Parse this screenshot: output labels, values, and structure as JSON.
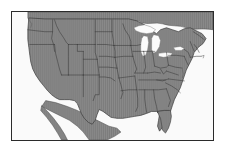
{
  "figure": {
    "kind": "map",
    "projection_hint": "equirectangular-like lon/lat plate",
    "frame": {
      "border_color": "#2b2b2b",
      "border_width_px": 1,
      "background_color": "#ffffff"
    }
  },
  "style": {
    "land_fill": "#8a8a8a",
    "land_hatch_color": "#767676",
    "land_hatch_orientation": "vertical",
    "water_fill": "#f7f7f7",
    "lake_fill": "#fbfbfb",
    "state_border_color": "#3a3a3a",
    "coastline_color": "#4a4a4a",
    "neighbor_fill": "#8a8a8a",
    "ocean_fill": "#fafafa"
  },
  "legend": {
    "present": false,
    "entries": []
  },
  "labels": {
    "present": false,
    "title": "",
    "subtitle": "",
    "texts": []
  },
  "regions": {
    "united_states_contiguous": {
      "name": "Contiguous United States",
      "fill": "#8a8a8a",
      "hatched": true
    },
    "mexico_baja": {
      "name": "Mexico / Baja California",
      "fill": "#8a8a8a",
      "hatched": true
    },
    "canada_southern_edge": {
      "name": "Canada southern edge",
      "fill": "#8a8a8a",
      "hatched": true
    }
  },
  "great_lakes": [
    {
      "name": "Lake Superior",
      "fill": "#fbfbfb"
    },
    {
      "name": "Lake Michigan",
      "fill": "#fbfbfb"
    },
    {
      "name": "Lake Huron",
      "fill": "#fbfbfb"
    },
    {
      "name": "Lake Erie",
      "fill": "#fbfbfb"
    },
    {
      "name": "Lake Ontario",
      "fill": "#fbfbfb"
    }
  ],
  "water_bodies": [
    {
      "name": "Pacific Ocean",
      "fill": "#fafafa"
    },
    {
      "name": "Atlantic Ocean",
      "fill": "#fafafa"
    },
    {
      "name": "Gulf of Mexico",
      "fill": "#fafafa"
    },
    {
      "name": "Gulf of California",
      "fill": "#fafafa"
    }
  ],
  "notable_features": [
    {
      "name": "Florida Peninsula"
    },
    {
      "name": "Baja California Peninsula"
    },
    {
      "name": "Puget Sound"
    },
    {
      "name": "Cape Cod"
    },
    {
      "name": "Chesapeake Bay"
    },
    {
      "name": "Great Salt Lake"
    }
  ],
  "axes": {
    "present": false,
    "tick_labels": []
  }
}
